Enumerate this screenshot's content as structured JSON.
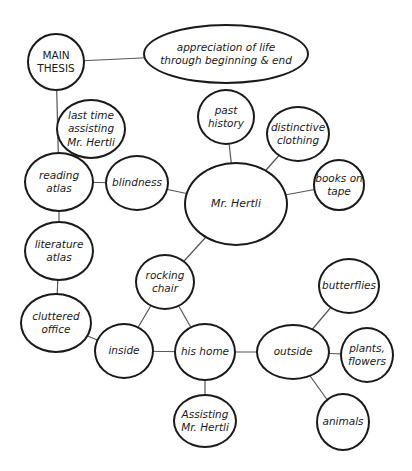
{
  "diagram": {
    "type": "concept-map",
    "colors": {
      "stroke": "#1a1a1a",
      "background": "#ffffff",
      "edge": "#555555"
    },
    "nodes": [
      {
        "id": "main_thesis",
        "label": "MAIN\nTHESIS",
        "cx": 56,
        "cy": 62,
        "rx": 29,
        "ry": 29,
        "upright": true
      },
      {
        "id": "appreciation",
        "label": "appreciation of life\nthrough beginning & end",
        "cx": 226,
        "cy": 54,
        "rx": 83,
        "ry": 30
      },
      {
        "id": "last_time",
        "label": "last time\nassisting\nMr. Hertli",
        "cx": 91,
        "cy": 129,
        "rx": 35,
        "ry": 30
      },
      {
        "id": "past_history",
        "label": "past\nhistory",
        "cx": 226,
        "cy": 117,
        "rx": 29,
        "ry": 28
      },
      {
        "id": "distinctive_clothing",
        "label": "distinctive\nclothing",
        "cx": 298,
        "cy": 134,
        "rx": 32,
        "ry": 28
      },
      {
        "id": "reading_atlas",
        "label": "reading\natlas",
        "cx": 59,
        "cy": 182,
        "rx": 35,
        "ry": 30
      },
      {
        "id": "blindness",
        "label": "blindness",
        "cx": 137,
        "cy": 183,
        "rx": 32,
        "ry": 28
      },
      {
        "id": "mr_hertli",
        "label": "Mr. Hertli",
        "cx": 236,
        "cy": 204,
        "rx": 52,
        "ry": 42
      },
      {
        "id": "books_on_tape",
        "label": "books on\ntape",
        "cx": 339,
        "cy": 185,
        "rx": 26,
        "ry": 26
      },
      {
        "id": "literature_atlas",
        "label": "literature\natlas",
        "cx": 59,
        "cy": 251,
        "rx": 35,
        "ry": 30
      },
      {
        "id": "rocking_chair",
        "label": "rocking\nchair",
        "cx": 165,
        "cy": 282,
        "rx": 30,
        "ry": 28
      },
      {
        "id": "cluttered_office",
        "label": "cluttered\noffice",
        "cx": 56,
        "cy": 323,
        "rx": 36,
        "ry": 30
      },
      {
        "id": "inside",
        "label": "inside",
        "cx": 124,
        "cy": 351,
        "rx": 30,
        "ry": 28
      },
      {
        "id": "his_home",
        "label": "his home",
        "cx": 205,
        "cy": 352,
        "rx": 31,
        "ry": 29
      },
      {
        "id": "butterflies",
        "label": "butterflies",
        "cx": 349,
        "cy": 286,
        "rx": 31,
        "ry": 28
      },
      {
        "id": "outside",
        "label": "outside",
        "cx": 293,
        "cy": 352,
        "rx": 37,
        "ry": 28
      },
      {
        "id": "plants_flowers",
        "label": "plants,\nflowers",
        "cx": 367,
        "cy": 355,
        "rx": 27,
        "ry": 28
      },
      {
        "id": "assisting",
        "label": "Assisting\nMr. Hertli",
        "cx": 205,
        "cy": 421,
        "rx": 32,
        "ry": 27
      },
      {
        "id": "animals",
        "label": "animals",
        "cx": 343,
        "cy": 422,
        "rx": 27,
        "ry": 29
      }
    ],
    "edges": [
      [
        "main_thesis",
        "appreciation"
      ],
      [
        "main_thesis",
        "reading_atlas"
      ],
      [
        "last_time",
        "reading_atlas"
      ],
      [
        "reading_atlas",
        "blindness"
      ],
      [
        "reading_atlas",
        "literature_atlas"
      ],
      [
        "blindness",
        "mr_hertli"
      ],
      [
        "past_history",
        "mr_hertli"
      ],
      [
        "distinctive_clothing",
        "mr_hertli"
      ],
      [
        "books_on_tape",
        "mr_hertli"
      ],
      [
        "mr_hertli",
        "rocking_chair"
      ],
      [
        "literature_atlas",
        "cluttered_office"
      ],
      [
        "cluttered_office",
        "inside"
      ],
      [
        "rocking_chair",
        "inside"
      ],
      [
        "rocking_chair",
        "his_home"
      ],
      [
        "inside",
        "his_home"
      ],
      [
        "his_home",
        "outside"
      ],
      [
        "his_home",
        "assisting"
      ],
      [
        "outside",
        "butterflies"
      ],
      [
        "outside",
        "plants_flowers"
      ],
      [
        "outside",
        "animals"
      ]
    ]
  }
}
